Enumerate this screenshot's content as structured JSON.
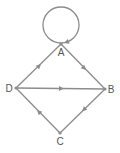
{
  "diagram": {
    "type": "directed-graph",
    "color": "#8c8c8c",
    "label_color": "#555555",
    "nodes": [
      {
        "id": "A",
        "label": "A"
      },
      {
        "id": "B",
        "label": "B"
      },
      {
        "id": "C",
        "label": "C"
      },
      {
        "id": "D",
        "label": "D"
      }
    ],
    "edges": [
      {
        "from": "A",
        "to": "A",
        "kind": "self-loop"
      },
      {
        "from": "A",
        "to": "B"
      },
      {
        "from": "D",
        "to": "A"
      },
      {
        "from": "D",
        "to": "B"
      },
      {
        "from": "B",
        "to": "C"
      },
      {
        "from": "C",
        "to": "D"
      }
    ]
  }
}
